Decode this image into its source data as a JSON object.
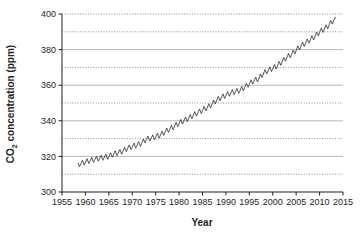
{
  "chart_data": {
    "type": "line",
    "title": "",
    "subtitle": "",
    "xlabel": "Year",
    "ylabel": "CO2 concentration (ppm)",
    "ylabel_parts": {
      "prefix": "CO",
      "subscript": "2",
      "suffix": " concentration (ppm)"
    },
    "xlim": [
      1955,
      2015
    ],
    "ylim": [
      300,
      400
    ],
    "xticks": [
      1955,
      1960,
      1965,
      1970,
      1975,
      1980,
      1985,
      1990,
      1995,
      2000,
      2005,
      2010,
      2015
    ],
    "xtick_labels": [
      "1955",
      "1960",
      "1965",
      "1970",
      "1975",
      "1980",
      "1985",
      "1990",
      "1995",
      "2000",
      "2005",
      "2010",
      "2015"
    ],
    "yticks": [
      300,
      320,
      340,
      360,
      380,
      400
    ],
    "ytick_labels": [
      "300",
      "320",
      "340",
      "360",
      "380",
      "400"
    ],
    "y_minor_gridlines": [
      310,
      330,
      350,
      370,
      390
    ],
    "y_major_gridlines": [
      320,
      340,
      360,
      380
    ],
    "grid": {
      "major_style": "solid",
      "major_color": "#9a9a9a",
      "minor_style": "dotted",
      "minor_color": "#6f6f6f",
      "vertical_grid": false
    },
    "legend": {
      "show": false,
      "position": "none"
    },
    "line_color": "#231f20",
    "line_width": 0.9,
    "axis_color": "#231f20",
    "background_color": "#ffffff",
    "series": [
      {
        "name": "Atmospheric CO2 (monthly mean)",
        "description": "Keeling curve: rising trend with annual seasonal sawtooth oscillation of about 3 ppm peak-to-trough",
        "annual_mean": {
          "x": [
            1958,
            1959,
            1960,
            1961,
            1962,
            1963,
            1964,
            1965,
            1966,
            1967,
            1968,
            1969,
            1970,
            1971,
            1972,
            1973,
            1974,
            1975,
            1976,
            1977,
            1978,
            1979,
            1980,
            1981,
            1982,
            1983,
            1984,
            1985,
            1986,
            1987,
            1988,
            1989,
            1990,
            1991,
            1992,
            1993,
            1994,
            1995,
            1996,
            1997,
            1998,
            1999,
            2000,
            2001,
            2002,
            2003,
            2004,
            2005,
            2006,
            2007,
            2008,
            2009,
            2010,
            2011,
            2012,
            2013
          ],
          "y": [
            315.3,
            315.9,
            316.9,
            317.6,
            318.4,
            318.9,
            319.5,
            320.0,
            321.3,
            322.1,
            323.0,
            324.6,
            325.6,
            326.3,
            327.4,
            329.7,
            330.2,
            331.1,
            332.0,
            333.8,
            335.4,
            336.8,
            338.7,
            340.1,
            341.4,
            343.0,
            344.6,
            346.0,
            347.4,
            349.2,
            351.6,
            353.1,
            354.4,
            355.6,
            356.4,
            357.1,
            358.8,
            360.8,
            362.6,
            363.7,
            366.6,
            368.3,
            369.5,
            371.0,
            373.2,
            375.6,
            377.4,
            379.7,
            381.9,
            383.8,
            385.6,
            387.4,
            389.9,
            391.6,
            393.8,
            396.5
          ]
        },
        "seasonal_amplitude_ppm": 3.1,
        "start_year": 1958,
        "end_year": 2013,
        "start_value": 315.3,
        "end_value": 399.5,
        "peak_value": 399.5,
        "trough_value": 313.3,
        "sampling": "monthly"
      }
    ]
  },
  "axes": {
    "x_title": "Year",
    "y_title_prefix": "CO",
    "y_title_subscript": "2",
    "y_title_suffix": " concentration (ppm)"
  }
}
